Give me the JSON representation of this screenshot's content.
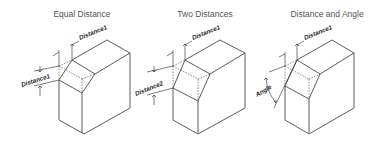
{
  "figure": {
    "panels": [
      {
        "title": "Equal Distance",
        "labels": {
          "top": "Distance1",
          "side": "Distance1"
        }
      },
      {
        "title": "Two Distances",
        "labels": {
          "top": "Distance1",
          "side": "Distance2"
        }
      },
      {
        "title": "Distance and Angle",
        "labels": {
          "top": "Distance1",
          "side": "Angle"
        }
      }
    ],
    "colors": {
      "line": "#333333",
      "title": "#555555",
      "background": "#ffffff"
    }
  }
}
